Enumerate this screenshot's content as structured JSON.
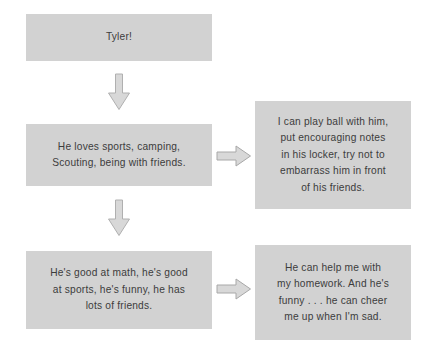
{
  "diagram": {
    "background_color": "#ffffff",
    "box_fill_color": "#d2d2d2",
    "text_color": "#3c3c3c",
    "arrow_fill_color": "#d8d8d8",
    "arrow_outline_color": "#a8a8a8",
    "nodes": [
      {
        "id": "tyler",
        "text": "Tyler!",
        "column": "left",
        "row": 1
      },
      {
        "id": "loves",
        "text": "He loves sports, camping,\nScouting, being with friends.",
        "column": "left",
        "row": 2
      },
      {
        "id": "goodat",
        "text": "He's good at math, he's good\nat sports, he's funny, he has\nlots of friends.",
        "column": "left",
        "row": 3
      },
      {
        "id": "playball",
        "text": "I can play ball with him,\nput encouraging notes\nin his locker, try not to\nembarrass him in front\nof his friends.",
        "column": "right",
        "row": 2
      },
      {
        "id": "helpme",
        "text": "He can help me with\nmy homework. And he's\nfunny . . . he can cheer\nme up when I'm sad.",
        "column": "right",
        "row": 3
      }
    ],
    "connectors": [
      {
        "id": "down-1",
        "direction": "down",
        "from": "tyler",
        "to": "loves"
      },
      {
        "id": "down-2",
        "direction": "down",
        "from": "loves",
        "to": "goodat"
      },
      {
        "id": "right-1",
        "direction": "right",
        "from": "loves",
        "to": "playball"
      },
      {
        "id": "right-2",
        "direction": "right",
        "from": "goodat",
        "to": "helpme"
      }
    ]
  }
}
